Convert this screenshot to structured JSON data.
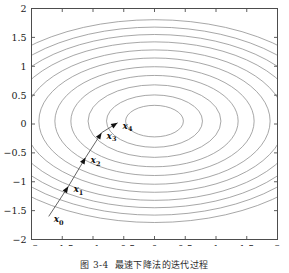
{
  "figure": {
    "caption_number": "图 3-4",
    "caption_text": "最速下降法的迭代过程",
    "background_color": "#ffffff",
    "frame_color": "#4d4d4d",
    "contour_color": "#8a8a8a",
    "path_color": "#555555",
    "marker_color": "#111111"
  },
  "chart_data": {
    "type": "line",
    "title": "",
    "subtitle": "",
    "xlabel": "",
    "ylabel": "",
    "xlim": [
      -2,
      2
    ],
    "ylim": [
      -2,
      2
    ],
    "grid": false,
    "legend": "none",
    "legend_position": "none",
    "xticks": [
      -2,
      -1.5,
      -1,
      -0.5,
      0,
      0.5,
      1,
      1.5,
      2
    ],
    "xticklabels": [
      "-2",
      "-1.5",
      "-1",
      "-0.5",
      "0",
      "0.5",
      "1",
      "1.5",
      "2"
    ],
    "yticks": [
      -2,
      -1.5,
      -1,
      -0.5,
      0,
      0.5,
      1,
      1.5,
      2
    ],
    "yticklabels": [
      "-2",
      "-1.5",
      "-1",
      "-0.5",
      "0",
      "0.5",
      "1",
      "1.5",
      "2"
    ],
    "contours": {
      "description": "concentric elliptical level sets of a quadratic objective",
      "center": [
        0.0,
        0.05
      ],
      "semi_axis_ratio": 1.72,
      "rotation_deg": 0,
      "levels_semi_x": [
        0.47,
        0.78,
        1.08,
        1.36,
        1.62,
        1.88,
        2.12,
        2.36,
        2.58,
        2.8,
        3.02
      ],
      "count": 11
    },
    "series": [
      {
        "name": "steepest descent iterates",
        "marker": "arrow",
        "points": [
          {
            "label": "x_0",
            "label_text": "x",
            "subscript": "0",
            "x": -1.72,
            "y": -1.6
          },
          {
            "label": "x_1",
            "label_text": "x",
            "subscript": "1",
            "x": -1.4,
            "y": -1.08
          },
          {
            "label": "x_2",
            "label_text": "x",
            "subscript": "2",
            "x": -1.12,
            "y": -0.58
          },
          {
            "label": "x_3",
            "label_text": "x",
            "subscript": "3",
            "x": -0.86,
            "y": -0.15
          },
          {
            "label": "x_4",
            "label_text": "x",
            "subscript": "4",
            "x": -0.6,
            "y": 0.02
          }
        ]
      }
    ]
  }
}
